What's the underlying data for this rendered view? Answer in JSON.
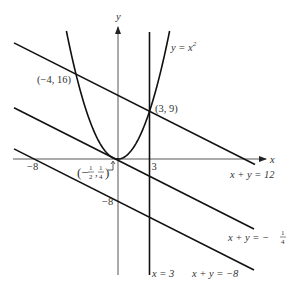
{
  "diagram": {
    "axes": {
      "x_label": "x",
      "y_label": "y",
      "x_range": [
        -9.9,
        13.8
      ],
      "y_range": [
        -21.7,
        24.3
      ]
    },
    "curves": [
      {
        "id": "parabola",
        "equation": "y = x^2",
        "label_main": "y = x",
        "label_sup": "2"
      }
    ],
    "lines": [
      {
        "id": "line-12",
        "a": 1,
        "b": 1,
        "c": 12,
        "label": "x + y = 12"
      },
      {
        "id": "line-neg-quarter",
        "a": 1,
        "b": 1,
        "c": -0.25,
        "label_main": "x + y = −",
        "label_num": "1",
        "label_den": "4"
      },
      {
        "id": "line-neg-8",
        "a": 1,
        "b": 1,
        "c": -8,
        "label": "x + y = −8"
      },
      {
        "id": "vline-3",
        "x": 3,
        "label": "x = 3"
      }
    ],
    "points": [
      {
        "x": -4,
        "y": 16,
        "label": "(−4, 16)"
      },
      {
        "x": 3,
        "y": 9,
        "label": "(3, 9)"
      },
      {
        "x": -0.5,
        "y": 0.25,
        "label_open": "(−",
        "label_n1": "1",
        "label_d1": "2",
        "label_sep": ",",
        "label_n2": "1",
        "label_d2": "4",
        "label_close": ")"
      }
    ],
    "ticks": {
      "x_neg8": "−8",
      "x_3": "3",
      "y_neg8": "−8"
    }
  }
}
